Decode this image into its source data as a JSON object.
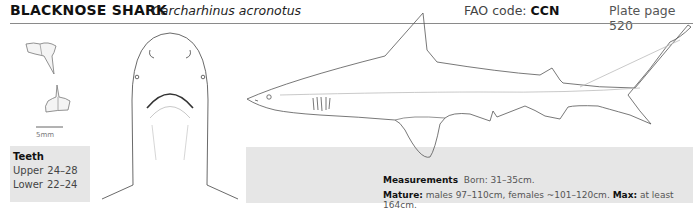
{
  "header": {
    "common_name": "BLACKNOSE SHARK",
    "scientific_name": "Carcharhinus acronotus",
    "fao_label": "FAO code:",
    "fao_code": "CCN",
    "plate_label": "Plate page 520"
  },
  "teeth_figure": {
    "scale_label": "5mm"
  },
  "teeth": {
    "title": "Teeth",
    "rows": [
      {
        "label": "Upper",
        "value": "24–28"
      },
      {
        "label": "Lower",
        "value": "22–24"
      }
    ]
  },
  "measurements": {
    "title": "Measurements",
    "born_label": "Born:",
    "born_value": "31–35cm.",
    "mature_label": "Mature:",
    "mature_value": "males 97–110cm, females ~101–120cm.",
    "max_label": "Max:",
    "max_value": "at least 164cm."
  },
  "illustrations": {
    "icons": [
      "upper-tooth-icon",
      "lower-tooth-icon",
      "shark-ventral-head-icon",
      "shark-lateral-body-icon"
    ],
    "line_color": "#555555",
    "panel_color": "#e6e6e6"
  }
}
